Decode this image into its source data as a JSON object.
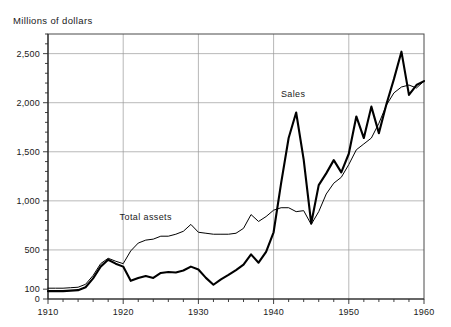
{
  "chart_data": {
    "type": "line",
    "title": "",
    "ylabel": "Millions of dollars",
    "xlabel": "",
    "xlim": [
      1910,
      1960
    ],
    "ylim": [
      0,
      2700
    ],
    "yticks": [
      0,
      100,
      500,
      1000,
      1500,
      2000,
      2500
    ],
    "ytick_labels": [
      "0",
      "100",
      "500",
      "1,000",
      "1,500",
      "2,000",
      "2,500"
    ],
    "gridline_values": [
      500,
      1000,
      1500,
      2000,
      2500
    ],
    "minor_tick_step": 100,
    "xticks": [
      1910,
      1920,
      1930,
      1940,
      1950,
      1960
    ],
    "xtick_labels": [
      "1910",
      "1920",
      "1930",
      "1940",
      "1950",
      "1960"
    ],
    "x_minor_tick_step": 2,
    "grid": true,
    "legend_position": "inline-annotations",
    "annotations": [
      {
        "text": "Sales",
        "x": 1942.6,
        "y": 2060
      },
      {
        "text": "Total assets",
        "x": 1923.0,
        "y": 810
      }
    ],
    "series": [
      {
        "name": "Sales",
        "color": "#000000",
        "line_width": 2.1,
        "x": [
          1910,
          1911,
          1912,
          1913,
          1914,
          1915,
          1916,
          1917,
          1918,
          1919,
          1920,
          1921,
          1922,
          1923,
          1924,
          1925,
          1926,
          1927,
          1928,
          1929,
          1930,
          1931,
          1932,
          1933,
          1934,
          1935,
          1936,
          1937,
          1938,
          1939,
          1940,
          1941,
          1942,
          1943,
          1944,
          1945,
          1946,
          1947,
          1948,
          1949,
          1950,
          1951,
          1952,
          1953,
          1954,
          1955,
          1956,
          1957,
          1958,
          1959,
          1960
        ],
        "values": [
          80,
          80,
          80,
          85,
          90,
          120,
          210,
          330,
          400,
          360,
          330,
          185,
          215,
          235,
          215,
          265,
          275,
          270,
          290,
          330,
          300,
          215,
          145,
          200,
          245,
          295,
          350,
          455,
          370,
          480,
          680,
          1180,
          1640,
          1900,
          1420,
          770,
          1160,
          1280,
          1415,
          1290,
          1480,
          1860,
          1640,
          1960,
          1690,
          1985,
          2240,
          2520,
          2080,
          2180,
          2220
        ]
      },
      {
        "name": "Total assets",
        "color": "#000000",
        "line_width": 1.0,
        "x": [
          1910,
          1911,
          1912,
          1913,
          1914,
          1915,
          1916,
          1917,
          1918,
          1919,
          1920,
          1921,
          1922,
          1923,
          1924,
          1925,
          1926,
          1927,
          1928,
          1929,
          1930,
          1931,
          1932,
          1933,
          1934,
          1935,
          1936,
          1937,
          1938,
          1939,
          1940,
          1941,
          1942,
          1943,
          1944,
          1945,
          1946,
          1947,
          1948,
          1949,
          1950,
          1951,
          1952,
          1953,
          1954,
          1955,
          1956,
          1957,
          1958,
          1959,
          1960
        ],
        "values": [
          110,
          110,
          110,
          115,
          120,
          150,
          240,
          360,
          415,
          385,
          360,
          490,
          570,
          600,
          610,
          640,
          640,
          660,
          690,
          760,
          680,
          670,
          660,
          660,
          660,
          670,
          720,
          860,
          790,
          840,
          905,
          930,
          930,
          890,
          900,
          760,
          890,
          1070,
          1180,
          1240,
          1370,
          1520,
          1580,
          1640,
          1790,
          1975,
          2100,
          2160,
          2180,
          2150,
          2220
        ]
      }
    ]
  },
  "figure": {
    "plot_left": 48,
    "plot_right": 424,
    "plot_top": 34,
    "plot_bottom": 299
  }
}
